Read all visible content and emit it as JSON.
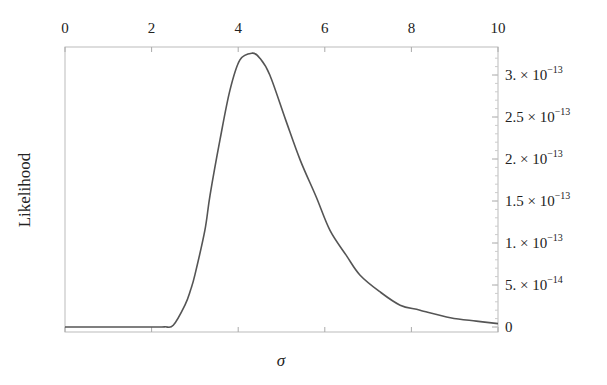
{
  "chart_data": {
    "type": "line",
    "title": "",
    "xlabel": "σ",
    "ylabel": "Likelihood",
    "xlim": [
      0,
      10
    ],
    "ylim": [
      0,
      3.3e-13
    ],
    "grid": false,
    "legend": null,
    "x_ticks": [
      {
        "value": 0,
        "label": "0"
      },
      {
        "value": 2,
        "label": "2"
      },
      {
        "value": 4,
        "label": "4"
      },
      {
        "value": 6,
        "label": "6"
      },
      {
        "value": 8,
        "label": "8"
      },
      {
        "value": 10,
        "label": "10"
      }
    ],
    "x_tick_position": "top",
    "y_ticks": [
      {
        "value": 0,
        "mantissa": "0",
        "exponent": ""
      },
      {
        "value": 5e-14,
        "mantissa": "5.",
        "exponent": "−14"
      },
      {
        "value": 1e-13,
        "mantissa": "1.",
        "exponent": "−13"
      },
      {
        "value": 1.5e-13,
        "mantissa": "1.5",
        "exponent": "−13"
      },
      {
        "value": 2e-13,
        "mantissa": "2.",
        "exponent": "−13"
      },
      {
        "value": 2.5e-13,
        "mantissa": "2.5",
        "exponent": "−13"
      },
      {
        "value": 3e-13,
        "mantissa": "3.",
        "exponent": "−13"
      }
    ],
    "y_tick_position": "right",
    "series": [
      {
        "name": "Likelihood",
        "color": "#555555",
        "x": [
          0,
          1,
          2,
          2.3,
          2.5,
          2.77,
          2.9,
          3.0,
          3.23,
          3.35,
          3.58,
          3.81,
          4.04,
          4.32,
          4.5,
          4.73,
          5.1,
          5.43,
          5.8,
          6.12,
          6.5,
          6.81,
          7.27,
          7.74,
          8.2,
          8.9,
          9.5,
          10
        ],
        "y": [
          0,
          0,
          0,
          2e-16,
          2e-15,
          2.6e-14,
          4.4e-14,
          6.2e-14,
          1.15e-13,
          1.57e-13,
          2.23e-13,
          2.82e-13,
          3.18e-13,
          3.26e-13,
          3.2e-13,
          3e-13,
          2.46e-13,
          1.99e-13,
          1.55e-13,
          1.15e-13,
          8.5e-14,
          6.2e-14,
          4.2e-14,
          2.6e-14,
          2e-14,
          1.1e-14,
          7e-15,
          4e-15
        ]
      }
    ]
  }
}
